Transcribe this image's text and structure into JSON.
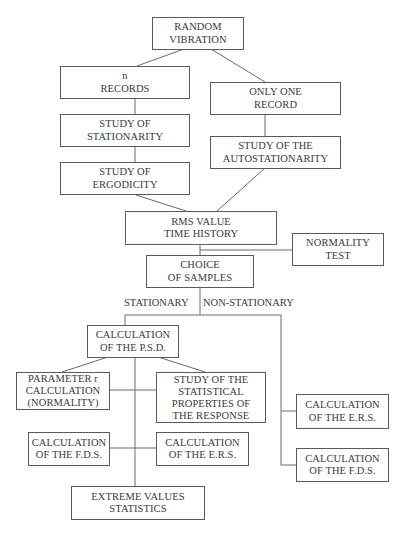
{
  "diagram": {
    "nodes": {
      "random_vibration": [
        "RANDOM",
        "VIBRATION"
      ],
      "n_records": [
        "n",
        "RECORDS"
      ],
      "only_one_record": [
        "ONLY ONE",
        "RECORD"
      ],
      "study_stationarity": [
        "STUDY OF",
        "STATIONARITY"
      ],
      "study_ergodicity": [
        "STUDY OF",
        "ERGODICITY"
      ],
      "study_autostationarity": [
        "STUDY OF THE",
        "AUTOSTATIONARITY"
      ],
      "rms_value": [
        "RMS VALUE",
        "TIME HISTORY"
      ],
      "normality_test": [
        "NORMALITY",
        "TEST"
      ],
      "choice_of_samples": [
        "CHOICE",
        "OF SAMPLES"
      ],
      "calc_psd": [
        "CALCULATION",
        "OF THE P.S.D."
      ],
      "parameter_r": [
        "PARAMETER r",
        "CALCULATION",
        "(NORMALITY)"
      ],
      "statistical_properties": [
        "STUDY OF THE",
        "STATISTICAL",
        "PROPERTIES OF",
        "THE RESPONSE"
      ],
      "calc_fds_left": [
        "CALCULATION",
        "OF THE F.D.S."
      ],
      "calc_ers_mid": [
        "CALCULATION",
        "OF THE E.R.S."
      ],
      "extreme_values": [
        "EXTREME VALUES",
        "STATISTICS"
      ],
      "calc_ers_right": [
        "CALCULATION",
        "OF THE E.R.S."
      ],
      "calc_fds_right": [
        "CALCULATION",
        "OF THE F.D.S."
      ]
    },
    "branch_labels": {
      "stationary": "STATIONARY",
      "non_stationary": "NON-STATIONARY"
    },
    "edges": [
      [
        "random_vibration",
        "n_records"
      ],
      [
        "random_vibration",
        "only_one_record"
      ],
      [
        "n_records",
        "study_stationarity"
      ],
      [
        "study_stationarity",
        "study_ergodicity"
      ],
      [
        "only_one_record",
        "study_autostationarity"
      ],
      [
        "study_ergodicity",
        "rms_value"
      ],
      [
        "study_autostationarity",
        "rms_value"
      ],
      [
        "rms_value",
        "choice_of_samples"
      ],
      [
        "rms_value",
        "normality_test"
      ],
      [
        "choice_of_samples",
        "calc_psd"
      ],
      [
        "choice_of_samples",
        "calc_ers_right"
      ],
      [
        "choice_of_samples",
        "calc_fds_right"
      ],
      [
        "calc_psd",
        "parameter_r"
      ],
      [
        "calc_psd",
        "statistical_properties"
      ],
      [
        "calc_psd",
        "calc_fds_left"
      ],
      [
        "calc_psd",
        "calc_ers_mid"
      ],
      [
        "calc_psd",
        "extreme_values"
      ]
    ]
  }
}
